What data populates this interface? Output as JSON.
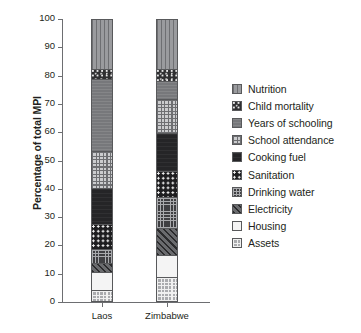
{
  "chart_data": {
    "type": "bar",
    "subtype": "stacked-bar-100",
    "title": "",
    "xlabel": "",
    "ylabel": "Percentage of total MPI",
    "ylim": [
      0,
      100
    ],
    "yticks": [
      0,
      10,
      20,
      30,
      40,
      50,
      60,
      70,
      80,
      90,
      100
    ],
    "ytick_labels": [
      "0",
      "10",
      "20",
      "30",
      "40",
      "50",
      "60",
      "70",
      "80",
      "90",
      "100"
    ],
    "categories": [
      "Laos",
      "Zimbabwe"
    ],
    "grid": false,
    "legend_position": "right",
    "stack_order_bottom_to_top": [
      "Assets",
      "Housing",
      "Electricity",
      "Drinking water",
      "Sanitation",
      "Cooking fuel",
      "School attendance",
      "Years of schooling",
      "Child mortality",
      "Nutrition"
    ],
    "series": [
      {
        "name": "Nutrition",
        "key": "nutrition",
        "pattern": "vertical-lines",
        "values": [
          18.5,
          18.5
        ]
      },
      {
        "name": "Child mortality",
        "key": "child-mortality",
        "pattern": "dark-speckle",
        "values": [
          3.5,
          4.0
        ]
      },
      {
        "name": "Years of schooling",
        "key": "years-schooling",
        "pattern": "solid-mid-gray",
        "values": [
          25.5,
          6.5
        ]
      },
      {
        "name": "School attendance",
        "key": "school-attendance",
        "pattern": "light-crosshatch",
        "values": [
          13.0,
          12.0
        ]
      },
      {
        "name": "Cooking fuel",
        "key": "cooking-fuel",
        "pattern": "solid-near-black",
        "values": [
          12.5,
          13.5
        ]
      },
      {
        "name": "Sanitation",
        "key": "sanitation",
        "pattern": "dark-with-white-dots",
        "values": [
          9.0,
          9.0
        ]
      },
      {
        "name": "Drinking water",
        "key": "drinking-water",
        "pattern": "dark-grid",
        "values": [
          5.0,
          11.0
        ]
      },
      {
        "name": "Electricity",
        "key": "electricity",
        "pattern": "diagonal-hatch",
        "values": [
          3.0,
          9.5
        ]
      },
      {
        "name": "Housing",
        "key": "housing",
        "pattern": "white-solid",
        "values": [
          6.5,
          8.0
        ]
      },
      {
        "name": "Assets",
        "key": "assets",
        "pattern": "light-checker",
        "values": [
          3.5,
          8.0
        ]
      }
    ],
    "stacks": [
      {
        "category": "Laos",
        "segments": [
          {
            "name": "Assets",
            "key": "assets",
            "start": 0.0,
            "end": 3.5,
            "value": 3.5
          },
          {
            "name": "Housing",
            "key": "housing",
            "start": 3.5,
            "end": 10.0,
            "value": 6.5
          },
          {
            "name": "Electricity",
            "key": "electricity",
            "start": 10.0,
            "end": 13.0,
            "value": 3.0
          },
          {
            "name": "Drinking water",
            "key": "drinking-water",
            "start": 13.0,
            "end": 18.0,
            "value": 5.0
          },
          {
            "name": "Sanitation",
            "key": "sanitation",
            "start": 18.0,
            "end": 27.0,
            "value": 9.0
          },
          {
            "name": "Cooking fuel",
            "key": "cooking-fuel",
            "start": 27.0,
            "end": 39.5,
            "value": 12.5
          },
          {
            "name": "School attendance",
            "key": "school-attendance",
            "start": 39.5,
            "end": 52.5,
            "value": 13.0
          },
          {
            "name": "Years of schooling",
            "key": "years-schooling",
            "start": 52.5,
            "end": 78.0,
            "value": 25.5
          },
          {
            "name": "Child mortality",
            "key": "child-mortality",
            "start": 78.0,
            "end": 81.5,
            "value": 3.5
          },
          {
            "name": "Nutrition",
            "key": "nutrition",
            "start": 81.5,
            "end": 100.0,
            "value": 18.5
          }
        ]
      },
      {
        "category": "Zimbabwe",
        "segments": [
          {
            "name": "Assets",
            "key": "assets",
            "start": 0.0,
            "end": 8.0,
            "value": 8.0
          },
          {
            "name": "Housing",
            "key": "housing",
            "start": 8.0,
            "end": 16.0,
            "value": 8.0
          },
          {
            "name": "Electricity",
            "key": "electricity",
            "start": 16.0,
            "end": 25.5,
            "value": 9.5
          },
          {
            "name": "Drinking water",
            "key": "drinking-water",
            "start": 25.5,
            "end": 36.5,
            "value": 11.0
          },
          {
            "name": "Sanitation",
            "key": "sanitation",
            "start": 36.5,
            "end": 45.5,
            "value": 9.0
          },
          {
            "name": "Cooking fuel",
            "key": "cooking-fuel",
            "start": 45.5,
            "end": 59.0,
            "value": 13.5
          },
          {
            "name": "School attendance",
            "key": "school-attendance",
            "start": 59.0,
            "end": 71.0,
            "value": 12.0
          },
          {
            "name": "Years of schooling",
            "key": "years-schooling",
            "start": 71.0,
            "end": 77.5,
            "value": 6.5
          },
          {
            "name": "Child mortality",
            "key": "child-mortality",
            "start": 77.5,
            "end": 81.5,
            "value": 4.0
          },
          {
            "name": "Nutrition",
            "key": "nutrition",
            "start": 81.5,
            "end": 100.0,
            "value": 18.5
          }
        ]
      }
    ],
    "legend": [
      {
        "label": "Nutrition",
        "key": "nutrition"
      },
      {
        "label": "Child mortality",
        "key": "child-mortality"
      },
      {
        "label": "Years of schooling",
        "key": "years-schooling"
      },
      {
        "label": "School attendance",
        "key": "school-attendance"
      },
      {
        "label": "Cooking fuel",
        "key": "cooking-fuel"
      },
      {
        "label": "Sanitation",
        "key": "sanitation"
      },
      {
        "label": "Drinking water",
        "key": "drinking-water"
      },
      {
        "label": "Electricity",
        "key": "electricity"
      },
      {
        "label": "Housing",
        "key": "housing"
      },
      {
        "label": "Assets",
        "key": "assets"
      }
    ],
    "colors": {
      "axis": "#6d6e71",
      "text": "#231f20",
      "outline": "#58595b",
      "background": "#ffffff"
    }
  }
}
